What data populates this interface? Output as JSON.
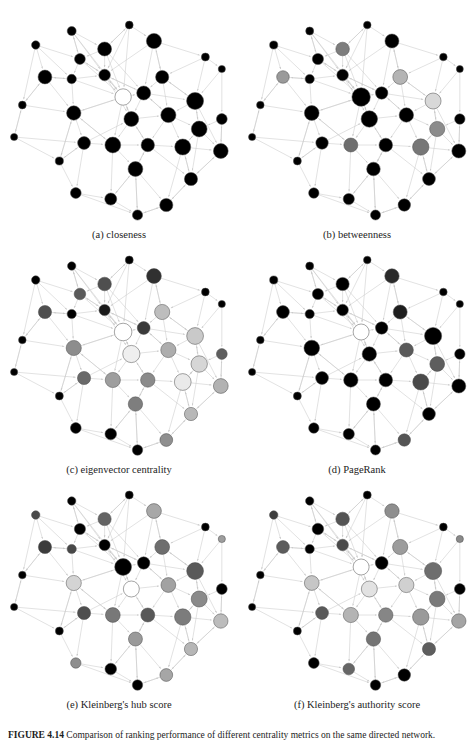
{
  "figure": {
    "caption_label": "FIGURE 4.14",
    "caption_text": "Comparison of ranking performance of different centrality metrics on the same directed network.",
    "panels": [
      {
        "id": "a",
        "caption": "(a) closeness"
      },
      {
        "id": "b",
        "caption": "(b) betweenness"
      },
      {
        "id": "c",
        "caption": "(c) eigenvector centrality"
      },
      {
        "id": "d",
        "caption": "(d) PageRank"
      },
      {
        "id": "e",
        "caption": "(e) Kleinberg's hub score"
      },
      {
        "id": "f",
        "caption": "(f) Kleinberg's authority score"
      }
    ]
  },
  "style": {
    "edge_color": "#c9c9c9",
    "node_stroke": "#4a4a4a",
    "background": "#ffffff",
    "shade_min": "#000000",
    "shade_max": "#ffffff"
  },
  "chart_data": {
    "type": "scatter",
    "title": "Comparison of ranking performance of different centrality metrics on the same directed network.",
    "xlabel": "",
    "ylabel": "",
    "grid": false,
    "legend": "none",
    "node_layout": [
      {
        "id": 0,
        "x": 60,
        "y": 22
      },
      {
        "id": 1,
        "x": 116,
        "y": 16
      },
      {
        "id": 2,
        "x": 25,
        "y": 36
      },
      {
        "id": 3,
        "x": 92,
        "y": 40
      },
      {
        "id": 4,
        "x": 140,
        "y": 32
      },
      {
        "id": 5,
        "x": 68,
        "y": 50
      },
      {
        "id": 6,
        "x": 190,
        "y": 48
      },
      {
        "id": 7,
        "x": 34,
        "y": 68
      },
      {
        "id": 8,
        "x": 60,
        "y": 70
      },
      {
        "id": 9,
        "x": 92,
        "y": 66
      },
      {
        "id": 10,
        "x": 148,
        "y": 68
      },
      {
        "id": 11,
        "x": 12,
        "y": 96
      },
      {
        "id": 12,
        "x": 110,
        "y": 88
      },
      {
        "id": 13,
        "x": 130,
        "y": 84
      },
      {
        "id": 14,
        "x": 180,
        "y": 92
      },
      {
        "id": 15,
        "x": 206,
        "y": 60
      },
      {
        "id": 16,
        "x": 62,
        "y": 104
      },
      {
        "id": 17,
        "x": 118,
        "y": 110
      },
      {
        "id": 18,
        "x": 154,
        "y": 106
      },
      {
        "id": 19,
        "x": 184,
        "y": 120
      },
      {
        "id": 20,
        "x": 4,
        "y": 128
      },
      {
        "id": 21,
        "x": 72,
        "y": 134
      },
      {
        "id": 22,
        "x": 100,
        "y": 136
      },
      {
        "id": 23,
        "x": 134,
        "y": 136
      },
      {
        "id": 24,
        "x": 168,
        "y": 138
      },
      {
        "id": 25,
        "x": 205,
        "y": 142
      },
      {
        "id": 26,
        "x": 48,
        "y": 152
      },
      {
        "id": 27,
        "x": 122,
        "y": 160
      },
      {
        "id": 28,
        "x": 176,
        "y": 170
      },
      {
        "id": 29,
        "x": 64,
        "y": 184
      },
      {
        "id": 30,
        "x": 98,
        "y": 190
      },
      {
        "id": 31,
        "x": 124,
        "y": 206
      },
      {
        "id": 32,
        "x": 152,
        "y": 196
      },
      {
        "id": 33,
        "x": 206,
        "y": 110
      }
    ],
    "edges": [
      [
        0,
        3
      ],
      [
        0,
        5
      ],
      [
        0,
        9
      ],
      [
        0,
        12
      ],
      [
        1,
        4
      ],
      [
        1,
        3
      ],
      [
        1,
        9
      ],
      [
        1,
        12
      ],
      [
        2,
        7
      ],
      [
        2,
        8
      ],
      [
        2,
        11
      ],
      [
        2,
        5
      ],
      [
        3,
        9
      ],
      [
        3,
        12
      ],
      [
        3,
        13
      ],
      [
        3,
        5
      ],
      [
        4,
        10
      ],
      [
        4,
        13
      ],
      [
        4,
        9
      ],
      [
        4,
        6
      ],
      [
        5,
        9
      ],
      [
        5,
        12
      ],
      [
        5,
        8
      ],
      [
        6,
        15
      ],
      [
        6,
        14
      ],
      [
        6,
        10
      ],
      [
        7,
        8
      ],
      [
        7,
        11
      ],
      [
        7,
        16
      ],
      [
        8,
        9
      ],
      [
        8,
        12
      ],
      [
        8,
        16
      ],
      [
        9,
        12
      ],
      [
        9,
        13
      ],
      [
        9,
        17
      ],
      [
        10,
        13
      ],
      [
        10,
        14
      ],
      [
        10,
        18
      ],
      [
        10,
        4
      ],
      [
        11,
        20
      ],
      [
        11,
        16
      ],
      [
        11,
        7
      ],
      [
        12,
        13
      ],
      [
        12,
        17
      ],
      [
        12,
        22
      ],
      [
        12,
        16
      ],
      [
        13,
        17
      ],
      [
        13,
        18
      ],
      [
        13,
        14
      ],
      [
        14,
        18
      ],
      [
        14,
        19
      ],
      [
        14,
        25
      ],
      [
        15,
        33
      ],
      [
        15,
        14
      ],
      [
        16,
        21
      ],
      [
        16,
        22
      ],
      [
        16,
        26
      ],
      [
        17,
        22
      ],
      [
        17,
        23
      ],
      [
        17,
        18
      ],
      [
        18,
        23
      ],
      [
        18,
        24
      ],
      [
        18,
        19
      ],
      [
        19,
        24
      ],
      [
        19,
        25
      ],
      [
        19,
        28
      ],
      [
        20,
        26
      ],
      [
        20,
        21
      ],
      [
        20,
        11
      ],
      [
        21,
        22
      ],
      [
        21,
        26
      ],
      [
        21,
        29
      ],
      [
        22,
        23
      ],
      [
        22,
        27
      ],
      [
        22,
        30
      ],
      [
        23,
        24
      ],
      [
        23,
        27
      ],
      [
        23,
        28
      ],
      [
        24,
        28
      ],
      [
        24,
        25
      ],
      [
        24,
        32
      ],
      [
        25,
        33
      ],
      [
        25,
        28
      ],
      [
        26,
        29
      ],
      [
        26,
        21
      ],
      [
        27,
        30
      ],
      [
        27,
        31
      ],
      [
        27,
        32
      ],
      [
        28,
        32
      ],
      [
        28,
        25
      ],
      [
        29,
        30
      ],
      [
        29,
        31
      ],
      [
        30,
        31
      ],
      [
        31,
        32
      ],
      [
        32,
        28
      ],
      [
        33,
        25
      ],
      [
        33,
        19
      ],
      [
        12,
        9
      ],
      [
        17,
        12
      ],
      [
        23,
        17
      ],
      [
        18,
        13
      ],
      [
        22,
        16
      ],
      [
        13,
        9
      ],
      [
        9,
        5
      ],
      [
        24,
        19
      ],
      [
        27,
        23
      ],
      [
        30,
        27
      ],
      [
        31,
        27
      ],
      [
        16,
        12
      ],
      [
        26,
        16
      ],
      [
        21,
        17
      ],
      [
        28,
        24
      ],
      [
        32,
        31
      ],
      [
        14,
        10
      ],
      [
        19,
        14
      ],
      [
        5,
        0
      ],
      [
        8,
        7
      ],
      [
        3,
        1
      ]
    ],
    "panel_series": [
      {
        "id": "a",
        "name": "closeness",
        "radii": [
          4.5,
          3.9,
          4.2,
          7.0,
          7.6,
          5.4,
          4.0,
          6.9,
          4.7,
          5.8,
          6.6,
          3.9,
          8.2,
          7.0,
          8.5,
          3.6,
          7.2,
          7.4,
          7.6,
          7.9,
          3.6,
          6.4,
          7.9,
          6.7,
          8.0,
          7.4,
          4.1,
          7.4,
          6.6,
          5.4,
          6.0,
          5.1,
          6.6,
          5.4
        ],
        "shades": [
          "#000000",
          "#000000",
          "#000000",
          "#000000",
          "#000000",
          "#000000",
          "#000000",
          "#000000",
          "#000000",
          "#000000",
          "#000000",
          "#000000",
          "#ffffff",
          "#000000",
          "#000000",
          "#000000",
          "#000000",
          "#000000",
          "#000000",
          "#000000",
          "#000000",
          "#000000",
          "#000000",
          "#000000",
          "#000000",
          "#000000",
          "#000000",
          "#000000",
          "#000000",
          "#000000",
          "#000000",
          "#000000",
          "#000000",
          "#000000"
        ]
      },
      {
        "id": "b",
        "name": "betweenness",
        "radii": [
          4.0,
          3.8,
          4.1,
          6.8,
          7.0,
          5.6,
          3.8,
          6.3,
          4.6,
          5.8,
          7.4,
          3.8,
          9.2,
          6.2,
          8.0,
          3.5,
          7.4,
          8.2,
          7.2,
          7.6,
          3.6,
          6.2,
          7.0,
          6.8,
          8.2,
          7.0,
          4.0,
          6.8,
          6.4,
          5.2,
          5.6,
          5.0,
          6.2,
          5.2
        ],
        "shades": [
          "#000000",
          "#000000",
          "#000000",
          "#7d7d7d",
          "#000000",
          "#000000",
          "#000000",
          "#9a9a9a",
          "#000000",
          "#000000",
          "#b4b4b4",
          "#000000",
          "#000000",
          "#000000",
          "#d8d8d8",
          "#000000",
          "#000000",
          "#000000",
          "#000000",
          "#8c8c8c",
          "#000000",
          "#000000",
          "#6e6e6e",
          "#000000",
          "#777777",
          "#000000",
          "#000000",
          "#000000",
          "#000000",
          "#000000",
          "#000000",
          "#000000",
          "#000000",
          "#000000"
        ]
      },
      {
        "id": "c",
        "name": "eigenvector centrality",
        "radii": [
          4.2,
          4.0,
          4.2,
          6.8,
          7.4,
          5.8,
          3.9,
          6.6,
          4.6,
          5.6,
          7.6,
          3.8,
          8.8,
          6.4,
          8.4,
          3.6,
          7.6,
          8.6,
          7.6,
          8.2,
          3.6,
          6.6,
          7.6,
          7.2,
          8.4,
          7.4,
          4.0,
          7.2,
          6.6,
          5.4,
          5.8,
          5.2,
          6.4,
          5.4
        ],
        "shades": [
          "#000000",
          "#000000",
          "#000000",
          "#4f4f4f",
          "#303030",
          "#5a5a5a",
          "#000000",
          "#505050",
          "#000000",
          "#1a1a1a",
          "#bdbdbd",
          "#000000",
          "#ffffff",
          "#3a3a3a",
          "#c9c9c9",
          "#000000",
          "#8d8d8d",
          "#efefef",
          "#adadad",
          "#d6d6d6",
          "#000000",
          "#6a6a6a",
          "#9e9e9e",
          "#8a8a8a",
          "#eaeaea",
          "#b2b2b2",
          "#000000",
          "#7e7e7e",
          "#b8b8b8",
          "#000000",
          "#000000",
          "#000000",
          "#8f8f8f",
          "#5e5e5e"
        ]
      },
      {
        "id": "d",
        "name": "PageRank",
        "radii": [
          4.0,
          3.8,
          4.1,
          6.6,
          7.2,
          5.6,
          3.8,
          6.4,
          4.6,
          5.8,
          7.0,
          3.8,
          8.0,
          6.2,
          8.6,
          3.6,
          7.8,
          7.2,
          7.0,
          7.4,
          3.6,
          6.4,
          7.2,
          6.8,
          8.0,
          7.0,
          4.0,
          7.0,
          6.4,
          5.2,
          5.6,
          5.0,
          6.2,
          5.2
        ],
        "shades": [
          "#000000",
          "#000000",
          "#000000",
          "#000000",
          "#2a2a2a",
          "#000000",
          "#000000",
          "#000000",
          "#000000",
          "#000000",
          "#1e1e1e",
          "#000000",
          "#ffffff",
          "#000000",
          "#000000",
          "#000000",
          "#000000",
          "#000000",
          "#5a5a5a",
          "#5e5e5e",
          "#000000",
          "#000000",
          "#000000",
          "#000000",
          "#4a4a4a",
          "#000000",
          "#000000",
          "#000000",
          "#000000",
          "#000000",
          "#000000",
          "#000000",
          "#555555",
          "#000000"
        ]
      },
      {
        "id": "e",
        "name": "Kleinberg's hub score",
        "radii": [
          4.2,
          4.0,
          4.2,
          6.6,
          7.4,
          5.6,
          3.9,
          6.6,
          4.6,
          5.6,
          7.4,
          3.8,
          8.4,
          6.2,
          8.4,
          3.6,
          7.6,
          8.0,
          7.4,
          8.0,
          3.6,
          6.6,
          7.4,
          7.0,
          8.2,
          7.2,
          4.0,
          7.0,
          6.6,
          5.2,
          5.8,
          5.2,
          6.4,
          5.4
        ],
        "shades": [
          "#000000",
          "#000000",
          "#4a4a4a",
          "#646464",
          "#a8a8a8",
          "#000000",
          "#000000",
          "#3c3c3c",
          "#484848",
          "#000000",
          "#6e6e6e",
          "#000000",
          "#000000",
          "#000000",
          "#5a5a5a",
          "#9d9d9d",
          "#d4d4d4",
          "#ffffff",
          "#a2a2a2",
          "#8a8a8a",
          "#000000",
          "#4e4e4e",
          "#787878",
          "#585858",
          "#7c7c7c",
          "#bcbcbc",
          "#000000",
          "#9a9a9a",
          "#b6b6b6",
          "#8e8e8e",
          "#000000",
          "#000000",
          "#a6a6a6",
          "#000000"
        ]
      },
      {
        "id": "f",
        "name": "Kleinberg's authority score",
        "radii": [
          4.2,
          4.0,
          4.2,
          6.8,
          7.2,
          5.8,
          3.9,
          6.4,
          4.6,
          5.8,
          7.6,
          3.8,
          8.0,
          6.4,
          8.6,
          3.6,
          7.4,
          8.0,
          7.6,
          7.8,
          3.6,
          6.4,
          7.6,
          7.2,
          8.2,
          7.2,
          4.0,
          7.2,
          6.6,
          5.4,
          5.8,
          5.2,
          6.2,
          5.4
        ],
        "shades": [
          "#000000",
          "#000000",
          "#3e3e3e",
          "#545454",
          "#8e8e8e",
          "#000000",
          "#000000",
          "#5c5c5c",
          "#000000",
          "#4a4a4a",
          "#9c9c9c",
          "#000000",
          "#ffffff",
          "#000000",
          "#6e6e6e",
          "#8a8a8a",
          "#c6c6c6",
          "#e2e2e2",
          "#d0d0d0",
          "#7a7a7a",
          "#000000",
          "#5a5a5a",
          "#b4b4b4",
          "#868686",
          "#9a9a9a",
          "#a4a4a4",
          "#000000",
          "#747474",
          "#5e5e5e",
          "#000000",
          "#666666",
          "#000000",
          "#000000",
          "#000000"
        ]
      }
    ]
  }
}
